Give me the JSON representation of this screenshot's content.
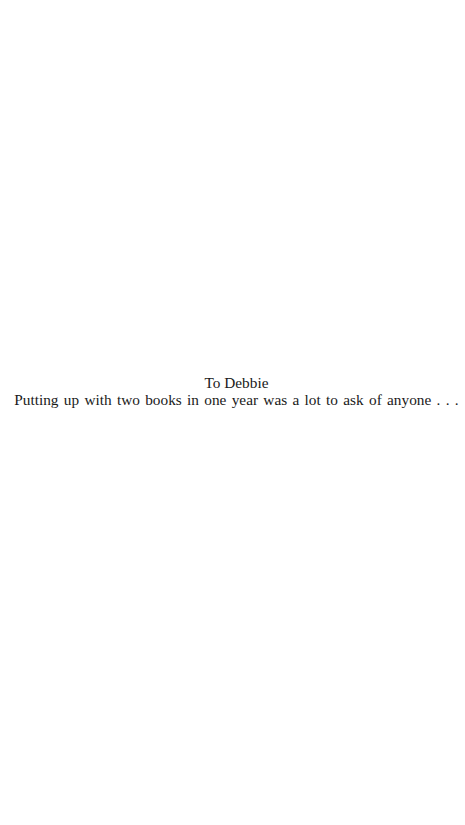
{
  "dedication": {
    "heading": "To Debbie",
    "body": "Putting up with two books in one year was a lot to ask of anyone . . ."
  },
  "colors": {
    "background": "#ffffff",
    "text": "#1a1a1a"
  }
}
